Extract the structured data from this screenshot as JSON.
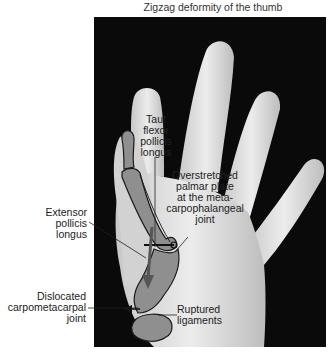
{
  "figure": {
    "title": "Zigzag deformity of the thumb",
    "colors": {
      "background": "#ffffff",
      "photo_background": "#0a0a0a",
      "skin": "#d9d9d9",
      "skin_highlight": "#efefef",
      "bone_fill": "#8f8f8f",
      "bone_outline": "#1a1a1a",
      "arrow": "#555555",
      "label_text": "#222222"
    },
    "labels": {
      "taut_flexor": [
        "Taut",
        "flexor",
        "pollicis",
        "longus"
      ],
      "overstretched_palmar_plate": [
        "Overstretched",
        "palmar plate",
        "at the meta-",
        "carpophalangeal",
        "joint"
      ],
      "extensor_pollicis_longus": [
        "Extensor",
        "pollicis",
        "longus"
      ],
      "dislocated_cmc_joint": [
        "Dislocated",
        "carpometacarpal",
        "joint"
      ],
      "ruptured_ligaments": [
        "Ruptured",
        "ligaments"
      ]
    }
  }
}
